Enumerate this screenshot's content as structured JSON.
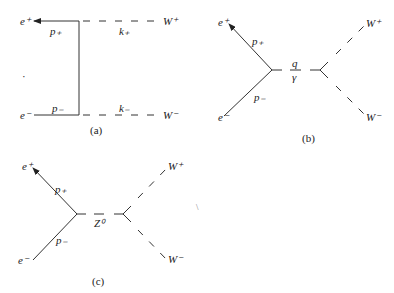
{
  "diagrams": [
    {
      "caption": "(a)",
      "type": "t-channel neutrino exchange",
      "labels": {
        "e_plus": "e⁺",
        "e_minus": "e⁻",
        "p_plus": "p₊",
        "p_minus": "p₋",
        "k_plus": "k₊",
        "k_minus": "k₋",
        "w_plus": "W⁺",
        "w_minus": "W⁻"
      }
    },
    {
      "caption": "(b)",
      "type": "s-channel photon exchange",
      "labels": {
        "e_plus": "e⁺",
        "e_minus": "e⁻",
        "p_plus": "p₊",
        "p_minus": "p₋",
        "q": "q",
        "propagator": "γ",
        "w_plus": "W⁺",
        "w_minus": "W⁻"
      }
    },
    {
      "caption": "(c)",
      "type": "s-channel Z boson exchange",
      "labels": {
        "e_plus": "e⁺",
        "e_minus": "e⁻",
        "p_plus": "p₊",
        "p_minus": "p₋",
        "propagator": "Z⁰",
        "w_plus": "W⁺",
        "w_minus": "W⁻"
      }
    }
  ]
}
